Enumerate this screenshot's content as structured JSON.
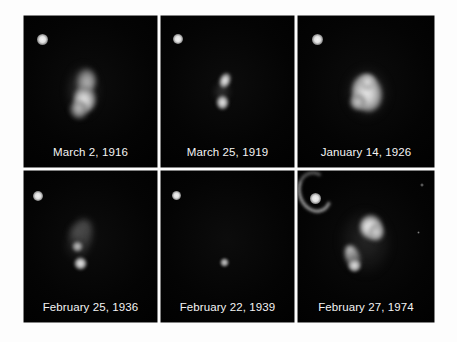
{
  "figure": {
    "background_color": "#fdfdfd",
    "panel_background": "#050505",
    "caption_color": "#f4f4f4",
    "layout": {
      "columns": 3,
      "rows": 2
    },
    "panels": [
      {
        "id": "panel-1",
        "caption": "March 2, 1916",
        "reference_star": "bright point source, upper-left corner",
        "nebula_description": "diffuse fan-shaped cloud with brighter lower knot, center of frame"
      },
      {
        "id": "panel-2",
        "caption": "March 25, 1919",
        "reference_star": "bright point source, upper-left corner",
        "nebula_description": "two small separated condensations, upper elongated knot and lower rounded knot"
      },
      {
        "id": "panel-3",
        "caption": "January 14, 1926",
        "reference_star": "bright point source, upper-left corner",
        "nebula_description": "large bright mottled blob tilted northwest-southeast"
      },
      {
        "id": "panel-4",
        "caption": "February 25, 1936",
        "reference_star": "bright point source, upper-left corner",
        "nebula_description": "faint diagonal wisp with a compact bright knot at its lower end"
      },
      {
        "id": "panel-5",
        "caption": "February 22, 1939",
        "reference_star": "bright point source, upper-left corner",
        "nebula_description": "single faint compact point near frame center, nebulosity nearly absent"
      },
      {
        "id": "panel-6",
        "caption": "February 27, 1974",
        "reference_star": "bright point source, upper-left corner",
        "nebula_description": "bright lobe at upper right with curved arc and streaming tail toward lower left; two faint field stars at right"
      }
    ]
  }
}
